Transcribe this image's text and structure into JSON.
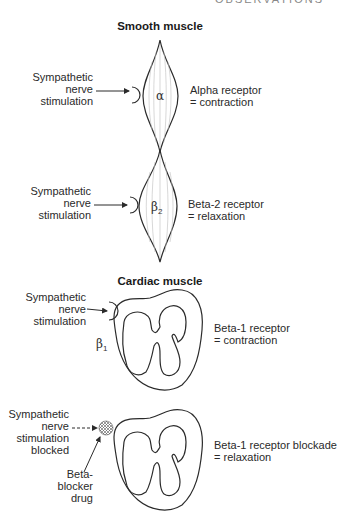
{
  "header": {
    "partial_title": "OBSERVATIONS"
  },
  "smooth_muscle": {
    "title": "Smooth muscle",
    "alpha": {
      "stimulus": [
        "Sympathetic",
        "nerve",
        "stimulation"
      ],
      "receptor_symbol": "α",
      "effect": [
        "Alpha receptor",
        "= contraction"
      ]
    },
    "beta2": {
      "stimulus": [
        "Sympathetic",
        "nerve",
        "stimulation"
      ],
      "receptor_symbol": "β",
      "receptor_subscript": "2",
      "effect": [
        "Beta-2 receptor",
        "= relaxation"
      ]
    }
  },
  "cardiac_muscle": {
    "title": "Cardiac muscle",
    "beta1": {
      "stimulus": [
        "Sympathetic",
        "nerve",
        "stimulation"
      ],
      "receptor_symbol": "β",
      "receptor_subscript": "1",
      "effect": [
        "Beta-1 receptor",
        "= contraction"
      ]
    },
    "blocked": {
      "stimulus": [
        "Sympathetic",
        "nerve",
        "stimulation",
        "blocked"
      ],
      "drug": [
        "Beta-",
        "blocker",
        "drug"
      ],
      "effect": [
        "Beta-1 receptor blockade",
        "= relaxation"
      ]
    }
  },
  "colors": {
    "ink": "#2b2b2b",
    "fiber": "#bdbdbd",
    "background": "#ffffff"
  }
}
